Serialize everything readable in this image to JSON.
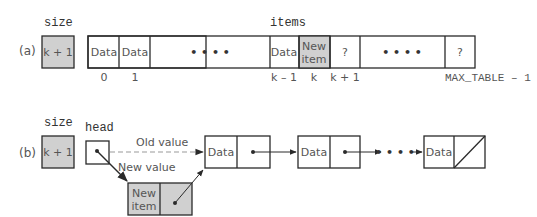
{
  "colors": {
    "stroke": "#2a2a2a",
    "shaded": "#d0d0d0",
    "text": "#555555",
    "dashed": "#999999"
  },
  "part_a": {
    "label": "(a)",
    "size_label": "size",
    "size_value": "k + 1",
    "items_label": "items",
    "cells": [
      {
        "text": "Data",
        "shaded": false
      },
      {
        "text": "Data",
        "shaded": false
      },
      {
        "text": "• • • •",
        "shaded": false
      },
      {
        "text": "Data",
        "shaded": false
      },
      {
        "text_line1": "New",
        "text_line2": "item",
        "shaded": true
      },
      {
        "text": "?",
        "shaded": false
      },
      {
        "text": "• • • •",
        "shaded": false
      },
      {
        "text": "?",
        "shaded": false
      }
    ],
    "indices": [
      "0",
      "1",
      "k – 1",
      "k",
      "k + 1",
      "MAX_TABLE – 1"
    ]
  },
  "part_b": {
    "label": "(b)",
    "size_label": "size",
    "size_value": "k + 1",
    "head_label": "head",
    "old_value_label": "Old value",
    "new_value_label": "New value",
    "nodes": [
      {
        "data": "Data"
      },
      {
        "data": "Data"
      },
      {
        "data": "Data"
      }
    ],
    "new_node": {
      "line1": "New",
      "line2": "item"
    },
    "ellipsis": "• • • •"
  }
}
